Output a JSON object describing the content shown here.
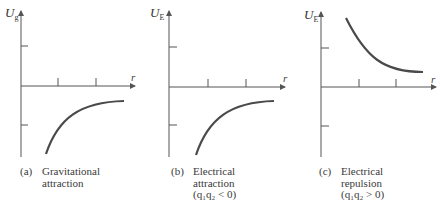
{
  "panels": [
    {
      "id": "a",
      "y_label": "U",
      "y_sub": "g",
      "x_label": "r",
      "caption_tag": "(a)",
      "caption_lines": [
        "Gravitational",
        "attraction"
      ],
      "curve": "negative, approaching zero from below"
    },
    {
      "id": "b",
      "y_label": "U",
      "y_sub": "E",
      "x_label": "r",
      "caption_tag": "(b)",
      "caption_lines": [
        "Electrical",
        "attraction",
        "(q₁q₂ < 0)"
      ],
      "curve": "negative, approaching zero from below"
    },
    {
      "id": "c",
      "y_label": "U",
      "y_sub": "E",
      "x_label": "r",
      "caption_tag": "(c)",
      "caption_lines": [
        "Electrical",
        "repulsion",
        "(q₁q₂ > 0)"
      ],
      "curve": "positive, decaying toward zero from above"
    }
  ],
  "colors": {
    "axis": "#555555",
    "curve": "#4a4a4a",
    "text": "#3a3a3a"
  }
}
